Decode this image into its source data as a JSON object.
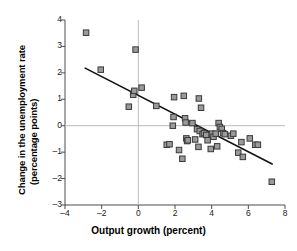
{
  "chart_data": {
    "type": "scatter",
    "title": "",
    "xlabel": "Output growth (percent)",
    "ylabel": "Change in the unemployment rate (percentage points)",
    "ylabel_line1": "Change in the unemployment rate",
    "ylabel_line2": "(percentage points)",
    "xlim": [
      -4,
      8
    ],
    "ylim": [
      -3,
      4
    ],
    "xticks": [
      -4,
      -2,
      0,
      2,
      4,
      6,
      8
    ],
    "xtick_labels": [
      "–4",
      "–2",
      "0",
      "2",
      "4",
      "6",
      "8"
    ],
    "yticks": [
      -3,
      -2,
      -1,
      0,
      1,
      2,
      3,
      4
    ],
    "ytick_labels": [
      "–3",
      "–2",
      "–1",
      "0",
      "1",
      "2",
      "3",
      "4"
    ],
    "grid": false,
    "zero_lines": {
      "x": 0,
      "y": 0,
      "color": "#bbbbbb"
    },
    "legend": null,
    "marker": {
      "shape": "square",
      "fill": "#9a9a9a",
      "edge": "#3a3a3a",
      "size": 5.5
    },
    "fit_line": {
      "label": "regression line",
      "color": "#111111",
      "width": 1.6,
      "x_start": -2.9,
      "y_start": 2.18,
      "x_end": 7.3,
      "y_end": -1.45,
      "slope": -0.356,
      "intercept": 1.15
    },
    "points": [
      {
        "x": -2.85,
        "y": 3.52
      },
      {
        "x": -2.05,
        "y": 2.12
      },
      {
        "x": -0.52,
        "y": 0.72
      },
      {
        "x": -0.28,
        "y": 1.17
      },
      {
        "x": -0.22,
        "y": 1.32
      },
      {
        "x": -0.15,
        "y": 2.88
      },
      {
        "x": 0.18,
        "y": 1.44
      },
      {
        "x": 0.98,
        "y": 0.75
      },
      {
        "x": 1.55,
        "y": -0.72
      },
      {
        "x": 1.7,
        "y": -0.7
      },
      {
        "x": 1.88,
        "y": 0.0
      },
      {
        "x": 1.92,
        "y": 0.33
      },
      {
        "x": 1.95,
        "y": 1.08
      },
      {
        "x": 2.22,
        "y": -0.92
      },
      {
        "x": 2.4,
        "y": -1.25
      },
      {
        "x": 2.48,
        "y": 1.13
      },
      {
        "x": 2.55,
        "y": 0.28
      },
      {
        "x": 2.58,
        "y": 0.12
      },
      {
        "x": 2.62,
        "y": -0.48
      },
      {
        "x": 2.66,
        "y": -0.58
      },
      {
        "x": 2.7,
        "y": -0.55
      },
      {
        "x": 2.95,
        "y": 0.1
      },
      {
        "x": 3.1,
        "y": -0.52
      },
      {
        "x": 3.2,
        "y": -0.13
      },
      {
        "x": 3.28,
        "y": -0.8
      },
      {
        "x": 3.3,
        "y": 1.03
      },
      {
        "x": 3.35,
        "y": -0.2
      },
      {
        "x": 3.42,
        "y": 0.68
      },
      {
        "x": 3.5,
        "y": -0.32
      },
      {
        "x": 3.58,
        "y": -0.28
      },
      {
        "x": 3.7,
        "y": -0.35
      },
      {
        "x": 3.78,
        "y": -0.55
      },
      {
        "x": 3.95,
        "y": -0.88
      },
      {
        "x": 4.02,
        "y": -0.3
      },
      {
        "x": 4.1,
        "y": -0.42
      },
      {
        "x": 4.22,
        "y": -0.3
      },
      {
        "x": 4.3,
        "y": -0.78
      },
      {
        "x": 4.38,
        "y": 0.1
      },
      {
        "x": 4.45,
        "y": -0.05
      },
      {
        "x": 4.55,
        "y": -0.12
      },
      {
        "x": 4.62,
        "y": -0.28
      },
      {
        "x": 4.72,
        "y": -0.32
      },
      {
        "x": 5.05,
        "y": -0.38
      },
      {
        "x": 5.18,
        "y": -0.3
      },
      {
        "x": 5.45,
        "y": -1.02
      },
      {
        "x": 5.62,
        "y": -0.62
      },
      {
        "x": 5.7,
        "y": -1.18
      },
      {
        "x": 6.08,
        "y": -0.48
      },
      {
        "x": 6.38,
        "y": -0.72
      },
      {
        "x": 6.52,
        "y": -0.72
      },
      {
        "x": 7.28,
        "y": -2.12
      }
    ]
  }
}
